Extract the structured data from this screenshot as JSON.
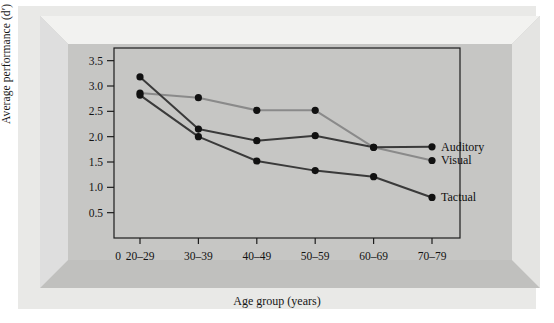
{
  "chart_data": {
    "type": "line",
    "title": "",
    "xlabel": "Age group (years)",
    "ylabel": "Average performance (d′)",
    "categories": [
      "20–29",
      "30–39",
      "40–49",
      "50–59",
      "60–69",
      "70–79"
    ],
    "ylim": [
      0,
      3.75
    ],
    "yticks": [
      0.5,
      1.0,
      1.5,
      2.0,
      2.5,
      3.0,
      3.5
    ],
    "ytick_labels": [
      "0.5",
      "1.0",
      "1.5",
      "2.0",
      "2.5",
      "3.0",
      "3.5"
    ],
    "origin_label": "0",
    "grid": false,
    "legend_position": "line-end-right",
    "series": [
      {
        "name": "Auditory",
        "color": "#3a3a3a",
        "values": [
          3.18,
          2.15,
          1.92,
          2.02,
          1.79,
          1.8
        ]
      },
      {
        "name": "Visual",
        "color": "#8a8a8a",
        "values": [
          2.86,
          2.77,
          2.52,
          2.52,
          1.79,
          1.53
        ]
      },
      {
        "name": "Tactual",
        "color": "#3a3a3a",
        "values": [
          2.82,
          2.0,
          1.52,
          1.33,
          1.21,
          0.8
        ]
      }
    ]
  },
  "figure": {
    "frame_color": "#c6c6c4",
    "panel_color": "#e9e9e7",
    "axis_color": "#1d1d1d"
  }
}
